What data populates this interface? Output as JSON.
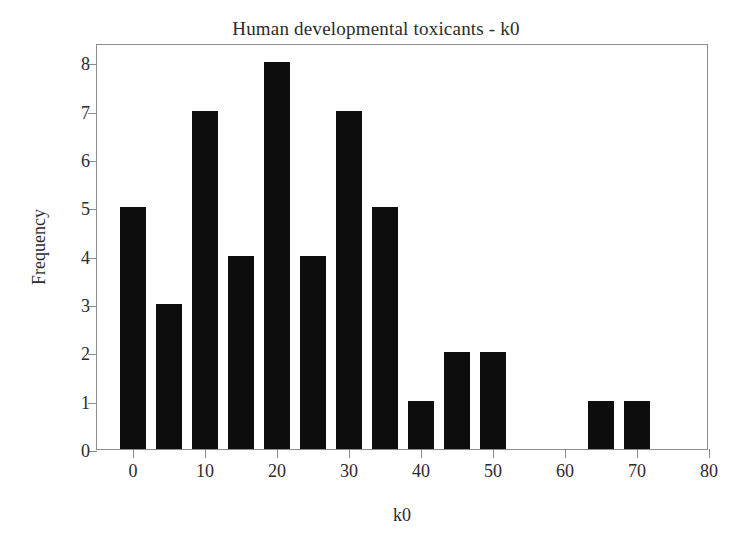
{
  "chart_data": {
    "type": "bar",
    "title": "Human developmental toxicants - k0",
    "xlabel": "k0",
    "ylabel": "Frequency",
    "xlim": [
      -5,
      80
    ],
    "ylim": [
      0,
      8.4
    ],
    "grid": false,
    "legend": null,
    "bin_width": 5,
    "xticks": [
      0,
      10,
      20,
      30,
      40,
      50,
      60,
      70,
      80
    ],
    "xtick_labels": [
      "0",
      "10",
      "20",
      "30",
      "40",
      "50",
      "60",
      "70",
      "80"
    ],
    "yticks": [
      0,
      1,
      2,
      3,
      4,
      5,
      6,
      7,
      8
    ],
    "ytick_labels": [
      "0",
      "1",
      "2",
      "3",
      "4",
      "5",
      "6",
      "7",
      "8"
    ],
    "bar_color": "#0d0d0d",
    "axis_color": "#8c8c8c",
    "background_color": "#ffffff",
    "categories": [
      "0",
      "5",
      "10",
      "15",
      "20",
      "25",
      "30",
      "35",
      "40",
      "45",
      "50",
      "65",
      "70"
    ],
    "bin_starts": [
      0,
      5,
      10,
      15,
      20,
      25,
      30,
      35,
      40,
      45,
      50,
      65,
      70
    ],
    "values": [
      5,
      3,
      7,
      4,
      8,
      4,
      7,
      5,
      1,
      2,
      2,
      1,
      1
    ]
  }
}
